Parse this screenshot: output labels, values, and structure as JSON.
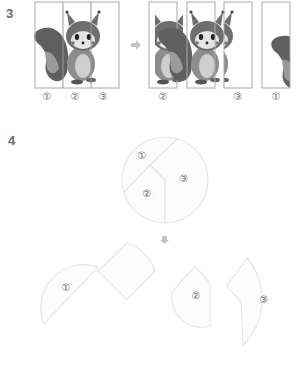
{
  "problem3": {
    "number": "3",
    "original_labels": [
      "①",
      "②",
      "③"
    ],
    "arrow_icon": "right-arrow-icon",
    "rearranged_labels": [
      "②",
      "",
      "③",
      "①"
    ]
  },
  "problem4": {
    "number": "4",
    "circle_labels": [
      "①",
      "②",
      "③"
    ],
    "arrow_icon": "down-arrow-icon",
    "pieces_labels": [
      "①",
      "",
      "②",
      "③"
    ]
  },
  "colors": {
    "panel_border": "#aaaaaa",
    "piece_stroke": "#e6e6e6",
    "piece_fill": "#fbfbfb",
    "arrow": "#c4c4c4"
  }
}
